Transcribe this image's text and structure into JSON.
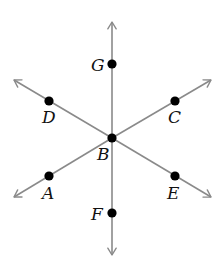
{
  "diagram": {
    "title": "",
    "center": {
      "id": "B",
      "label": "B",
      "x": 112,
      "y": 138,
      "label_x": 97,
      "label_y": 160
    },
    "line_color": "#8a8a8a",
    "point_color": "#000000",
    "rays": [
      {
        "id": "ray-BG",
        "direction": "up",
        "tip_x": 112,
        "tip_y": 22
      },
      {
        "id": "ray-BF",
        "direction": "down",
        "tip_x": 112,
        "tip_y": 255
      },
      {
        "id": "ray-BD",
        "direction": "upper-left",
        "tip_x": 14,
        "tip_y": 80
      },
      {
        "id": "ray-BC",
        "direction": "upper-right",
        "tip_x": 211,
        "tip_y": 80
      },
      {
        "id": "ray-BA",
        "direction": "lower-left",
        "tip_x": 14,
        "tip_y": 197
      },
      {
        "id": "ray-BE",
        "direction": "lower-right",
        "tip_x": 211,
        "tip_y": 197
      }
    ],
    "points": [
      {
        "id": "G",
        "label": "G",
        "x": 112,
        "y": 64,
        "label_x": 91,
        "label_y": 71
      },
      {
        "id": "D",
        "label": "D",
        "x": 49,
        "y": 101,
        "label_x": 42,
        "label_y": 123
      },
      {
        "id": "C",
        "label": "C",
        "x": 175,
        "y": 101,
        "label_x": 168,
        "label_y": 123
      },
      {
        "id": "A",
        "label": "A",
        "x": 49,
        "y": 176,
        "label_x": 42,
        "label_y": 199
      },
      {
        "id": "E",
        "label": "E",
        "x": 175,
        "y": 176,
        "label_x": 167,
        "label_y": 199
      },
      {
        "id": "F",
        "label": "F",
        "x": 112,
        "y": 213,
        "label_x": 91,
        "label_y": 220
      }
    ]
  }
}
